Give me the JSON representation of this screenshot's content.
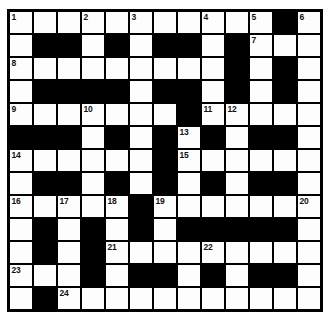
{
  "puzzle": {
    "type": "crossword-grid",
    "title": "Crossword Puzzle Grid",
    "columns": 13,
    "rows": 13,
    "colors": {
      "block": "#000000",
      "cell": "#fdfdfd",
      "grid_line": "#000000",
      "number_text": "#111111",
      "page_background": "#ffffff"
    },
    "legend": {
      "0": "white (fillable) cell",
      "1": "black (blocked) cell"
    },
    "grid": [
      [
        0,
        0,
        0,
        0,
        0,
        0,
        0,
        0,
        0,
        0,
        0,
        1,
        0
      ],
      [
        0,
        1,
        1,
        0,
        1,
        0,
        1,
        1,
        0,
        1,
        0,
        0,
        0
      ],
      [
        0,
        0,
        0,
        0,
        0,
        0,
        0,
        0,
        0,
        1,
        0,
        1,
        0
      ],
      [
        0,
        1,
        1,
        1,
        1,
        0,
        1,
        1,
        0,
        1,
        0,
        1,
        0
      ],
      [
        0,
        0,
        0,
        0,
        0,
        0,
        0,
        1,
        0,
        0,
        0,
        0,
        0
      ],
      [
        1,
        1,
        1,
        0,
        1,
        0,
        1,
        0,
        1,
        0,
        1,
        1,
        0
      ],
      [
        0,
        0,
        0,
        0,
        0,
        0,
        1,
        0,
        0,
        0,
        0,
        0,
        0
      ],
      [
        0,
        1,
        1,
        0,
        1,
        0,
        1,
        0,
        1,
        0,
        1,
        1,
        0
      ],
      [
        0,
        0,
        0,
        0,
        0,
        1,
        0,
        0,
        0,
        0,
        0,
        0,
        0
      ],
      [
        0,
        1,
        0,
        1,
        0,
        1,
        0,
        1,
        1,
        1,
        1,
        1,
        0
      ],
      [
        0,
        1,
        0,
        1,
        0,
        0,
        0,
        0,
        0,
        0,
        0,
        0,
        0
      ],
      [
        0,
        0,
        0,
        1,
        0,
        1,
        1,
        0,
        1,
        0,
        1,
        1,
        0
      ],
      [
        0,
        1,
        0,
        0,
        0,
        0,
        0,
        0,
        0,
        0,
        0,
        0,
        0
      ]
    ],
    "numbers": [
      {
        "clue": "1",
        "row": 1,
        "col": 1
      },
      {
        "clue": "2",
        "row": 1,
        "col": 4
      },
      {
        "clue": "3",
        "row": 1,
        "col": 6
      },
      {
        "clue": "4",
        "row": 1,
        "col": 9
      },
      {
        "clue": "5",
        "row": 1,
        "col": 11
      },
      {
        "clue": "6",
        "row": 1,
        "col": 13
      },
      {
        "clue": "7",
        "row": 2,
        "col": 11
      },
      {
        "clue": "8",
        "row": 3,
        "col": 1
      },
      {
        "clue": "9",
        "row": 5,
        "col": 1
      },
      {
        "clue": "10",
        "row": 5,
        "col": 4
      },
      {
        "clue": "11",
        "row": 5,
        "col": 9
      },
      {
        "clue": "12",
        "row": 5,
        "col": 10
      },
      {
        "clue": "13",
        "row": 6,
        "col": 8
      },
      {
        "clue": "14",
        "row": 7,
        "col": 1
      },
      {
        "clue": "15",
        "row": 7,
        "col": 8
      },
      {
        "clue": "16",
        "row": 9,
        "col": 1
      },
      {
        "clue": "17",
        "row": 9,
        "col": 3
      },
      {
        "clue": "18",
        "row": 9,
        "col": 5
      },
      {
        "clue": "19",
        "row": 9,
        "col": 7
      },
      {
        "clue": "20",
        "row": 9,
        "col": 13
      },
      {
        "clue": "21",
        "row": 11,
        "col": 5
      },
      {
        "clue": "22",
        "row": 11,
        "col": 9
      },
      {
        "clue": "23",
        "row": 12,
        "col": 1
      },
      {
        "clue": "24",
        "row": 13,
        "col": 3
      }
    ]
  }
}
